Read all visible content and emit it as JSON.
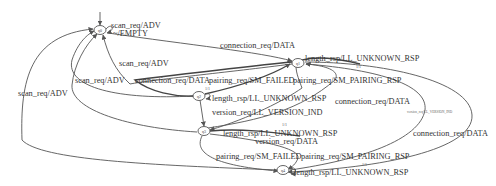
{
  "diagram": {
    "type": "state-machine",
    "initial_state": "q0",
    "states": [
      {
        "id": "q0",
        "label": "q0"
      },
      {
        "id": "q1",
        "label": "q1"
      },
      {
        "id": "q2",
        "label": "q2"
      },
      {
        "id": "q3",
        "label": "q3"
      },
      {
        "id": "q4",
        "label": "q4"
      }
    ],
    "edges": [
      {
        "id": "e0",
        "from": "q0",
        "to": "q0",
        "label": "scan_req/ADV"
      },
      {
        "id": "e1",
        "from": "q0",
        "to": "q0",
        "label": "~/EMPTY"
      },
      {
        "id": "e2",
        "from": "q0",
        "to": "q1",
        "label": "connection_req/DATA"
      },
      {
        "id": "e3",
        "from": "q1",
        "to": "q0",
        "label": "scan_req/ADV"
      },
      {
        "id": "e4",
        "from": "q2",
        "to": "q0",
        "label": "scan_req/ADV"
      },
      {
        "id": "e5",
        "from": "q2",
        "to": "q1",
        "label": "connection_req/DATA"
      },
      {
        "id": "e6",
        "from": "q1",
        "to": "q2",
        "label": "pairing_req/SM_FAILED"
      },
      {
        "id": "e7",
        "from": "q1",
        "to": "q1",
        "label": "length_rsp/LL_UNKNOWN_RSP"
      },
      {
        "id": "e8",
        "from": "q1",
        "to": "q3",
        "label": "pairing_req/SM_PAIRING_RSP"
      },
      {
        "id": "e9",
        "from": "q2",
        "to": "q2",
        "label": "length_rsp/LL_UNKNOWN_RSP"
      },
      {
        "id": "e10",
        "from": "q2",
        "to": "q3",
        "label": "version_req/LL_VERSION_IND"
      },
      {
        "id": "e11",
        "from": "q3",
        "to": "q1",
        "label": "connection_req/DATA"
      },
      {
        "id": "e12",
        "from": "q3",
        "to": "q3",
        "label": "length_rsp/LL_UNKNOWN_RSP"
      },
      {
        "id": "e13",
        "from": "q3",
        "to": "q3",
        "label": "version_req/DATA"
      },
      {
        "id": "e14",
        "from": "q3",
        "to": "q4",
        "label": "pairing_req/SM_FAILED"
      },
      {
        "id": "e15",
        "from": "q3",
        "to": "q4",
        "label": "pairing_req/SM_PAIRING_RSP"
      },
      {
        "id": "e16",
        "from": "q4",
        "to": "q0",
        "label": "scan_req/ADV"
      },
      {
        "id": "e17",
        "from": "q4",
        "to": "q4",
        "label": "length_rsp/LL_UNKNOWN_RSP"
      },
      {
        "id": "e18",
        "from": "q1",
        "to": "q4",
        "label": "version_req/LL_VERSION_IND"
      },
      {
        "id": "e19",
        "from": "q4",
        "to": "q1",
        "label": "connection_req/DATA"
      },
      {
        "id": "e20",
        "from": "q4",
        "to": "q0",
        "label": "scan_req/ADV"
      }
    ],
    "small_marks": [
      "1/1",
      "1/1",
      "1/1",
      "1/1"
    ]
  }
}
